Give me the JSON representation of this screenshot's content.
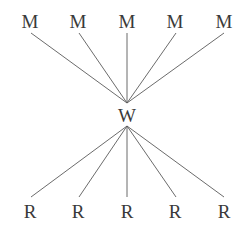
{
  "diagram": {
    "type": "bipartite-star",
    "center": {
      "label": "W",
      "x": 127,
      "y": 107
    },
    "top_nodes": [
      {
        "label": "M",
        "x": 30
      },
      {
        "label": "M",
        "x": 78
      },
      {
        "label": "M",
        "x": 127
      },
      {
        "label": "M",
        "x": 175
      },
      {
        "label": "M",
        "x": 224
      }
    ],
    "bottom_nodes": [
      {
        "label": "R",
        "x": 30
      },
      {
        "label": "R",
        "x": 78
      },
      {
        "label": "R",
        "x": 127
      },
      {
        "label": "R",
        "x": 175
      },
      {
        "label": "R",
        "x": 224
      }
    ],
    "line_color": "#5a5a5a",
    "text_color": "#3a3a3a"
  }
}
